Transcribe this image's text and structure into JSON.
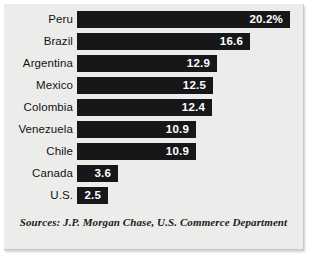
{
  "figure": {
    "background_color": "#ececeb",
    "bar_color": "#17171a",
    "value_text_color": "#ffffff",
    "label_text_color": "#121212"
  },
  "source_note": "Sources: J.P. Morgan Chase, U.S. Commerce Department",
  "chart_data": {
    "type": "bar",
    "orientation": "horizontal",
    "title": "",
    "subtitle": "",
    "xlabel": "",
    "ylabel": "",
    "grid": false,
    "legend": null,
    "value_suffix_first_only": "%",
    "categories": [
      "Peru",
      "Brazil",
      "Argentina",
      "Mexico",
      "Colombia",
      "Venezuela",
      "Chile",
      "Canada",
      "U.S."
    ],
    "values": [
      20.2,
      16.6,
      12.9,
      12.5,
      12.4,
      10.9,
      10.9,
      3.6,
      2.5
    ],
    "value_labels": [
      "20.2%",
      "16.6",
      "12.9",
      "12.5",
      "12.4",
      "10.9",
      "10.9",
      "3.6",
      "2.5"
    ],
    "bar_pixel_widths": [
      213,
      173,
      140,
      136,
      135,
      119,
      119,
      41,
      31
    ],
    "xlim": [
      0,
      20.2
    ]
  },
  "rows": [
    {
      "label": "Peru",
      "value_label": "20.2%",
      "width_px": 213
    },
    {
      "label": "Brazil",
      "value_label": "16.6",
      "width_px": 173
    },
    {
      "label": "Argentina",
      "value_label": "12.9",
      "width_px": 140
    },
    {
      "label": "Mexico",
      "value_label": "12.5",
      "width_px": 136
    },
    {
      "label": "Colombia",
      "value_label": "12.4",
      "width_px": 135
    },
    {
      "label": "Venezuela",
      "value_label": "10.9",
      "width_px": 119
    },
    {
      "label": "Chile",
      "value_label": "10.9",
      "width_px": 119
    },
    {
      "label": "Canada",
      "value_label": "3.6",
      "width_px": 41
    },
    {
      "label": "U.S.",
      "value_label": "2.5",
      "width_px": 31
    }
  ]
}
